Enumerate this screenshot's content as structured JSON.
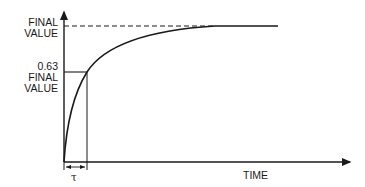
{
  "diagram": {
    "y_labels": {
      "final": [
        "FINAL",
        "VALUE"
      ],
      "intermediate": [
        "0.63",
        "FINAL",
        "VALUE"
      ]
    },
    "x_label": "TIME",
    "tau_label": "τ",
    "curve_fraction_at_tau": 0.63,
    "colors": {
      "line": "#1a1a1a",
      "background": "#ffffff"
    }
  }
}
